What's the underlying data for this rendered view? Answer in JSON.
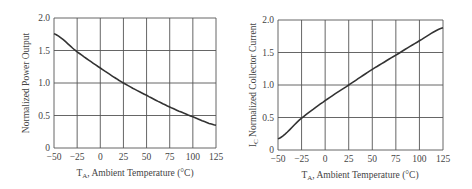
{
  "chart_data": [
    {
      "type": "line",
      "title": "",
      "xlabel": "T_A, Ambient Temperature (°C)",
      "xlabel_main": "T",
      "xlabel_sub": "A",
      "xlabel_rest": ", Ambient Temperature (°C)",
      "ylabel": "Normalized Power Output",
      "xlim": [
        -50,
        125
      ],
      "ylim": [
        0,
        2.0
      ],
      "grid": true,
      "x_ticks": [
        "−50",
        "−25",
        "0",
        "25",
        "50",
        "75",
        "100",
        "125"
      ],
      "y_ticks": [
        "0",
        "0.5",
        "1.0",
        "1.5",
        "2.0"
      ],
      "series": [
        {
          "name": "Normalized Power Output",
          "x": [
            -50,
            -25,
            0,
            25,
            50,
            75,
            100,
            125
          ],
          "y": [
            1.76,
            1.48,
            1.23,
            1.0,
            0.81,
            0.63,
            0.48,
            0.35
          ]
        }
      ]
    },
    {
      "type": "line",
      "title": "",
      "xlabel": "T_A, Ambient Temperature (°C)",
      "xlabel_main": "T",
      "xlabel_sub": "A",
      "xlabel_rest": ", Ambient Temperature (°C)",
      "ylabel": "I_C Normalized Collector Current",
      "ylabel_main": "I",
      "ylabel_sub": "C",
      "ylabel_rest": " Normalized Collector Current",
      "xlim": [
        -50,
        125
      ],
      "ylim": [
        0,
        2.0
      ],
      "grid": true,
      "x_ticks": [
        "−50",
        "−25",
        "0",
        "25",
        "50",
        "75",
        "100",
        "125"
      ],
      "y_ticks": [
        "0",
        "0.5",
        "1.0",
        "1.5",
        "2.0"
      ],
      "series": [
        {
          "name": "Normalized Collector Current",
          "x": [
            -50,
            -25,
            0,
            25,
            50,
            75,
            100,
            125
          ],
          "y": [
            0.17,
            0.49,
            0.76,
            1.0,
            1.24,
            1.46,
            1.68,
            1.88
          ]
        }
      ]
    }
  ]
}
